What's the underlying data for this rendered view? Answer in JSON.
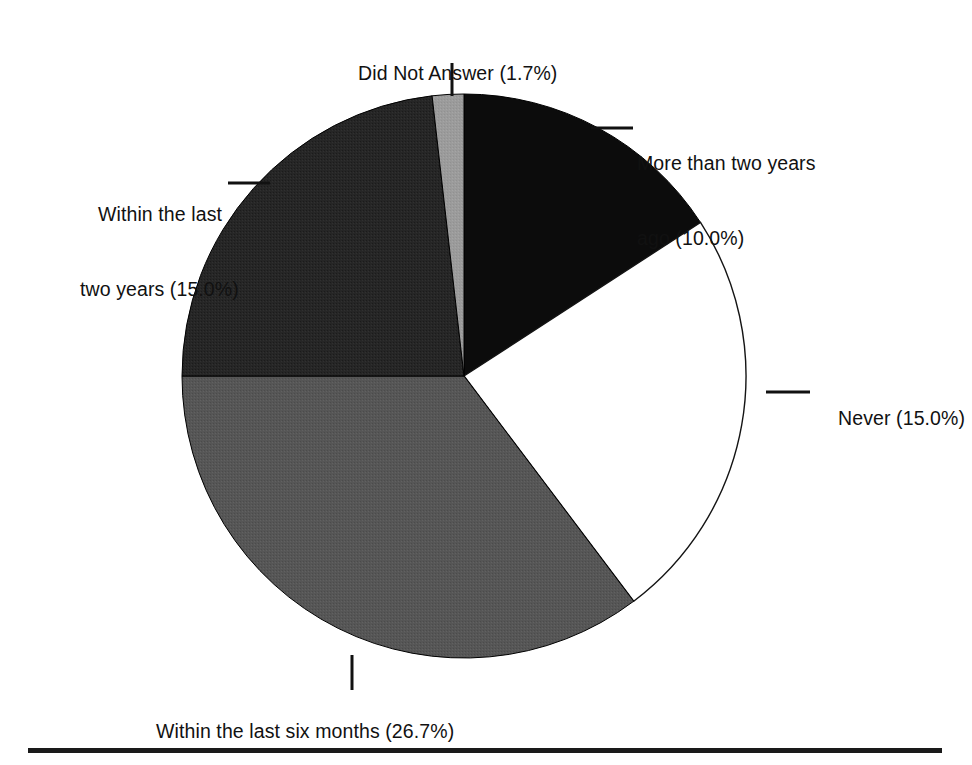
{
  "figure": {
    "background_color": "#ffffff",
    "text_color": "#111111",
    "baseline_rule_color": "#1a1a1a"
  },
  "chart_data": {
    "type": "pie",
    "title": "",
    "subtitle": "",
    "xlabel": "",
    "ylabel": "",
    "legend_position": "none",
    "grid": false,
    "labels_outside": true,
    "units": "percent",
    "categories": [
      "More than two years ago",
      "Never",
      "Within the last six months",
      "Within the last two years",
      "Did Not Answer"
    ],
    "values": [
      10.0,
      15.0,
      26.7,
      15.0,
      1.7
    ],
    "value_labels": [
      "10.0%",
      "15.0%",
      "26.7%",
      "15.0%",
      "1.7%"
    ],
    "display_labels": [
      "More than two years\nago (10.0%)",
      "Never (15.0%)",
      "Within the last six months (26.7%)",
      "Within the last\ntwo years (15.0%)",
      "Did Not Answer (1.7%)"
    ],
    "slice_colors": [
      "#0c0c0c",
      "#ffffff",
      "#555555",
      "#262626",
      "#9a9a9a"
    ],
    "slice_edge_color": "#000000",
    "start_angle_deg": 0,
    "direction": "clockwise",
    "geometry": {
      "center_x": 464,
      "center_y": 376,
      "radius": 282,
      "slice_angles_deg": [
        {
          "name": "More than two years ago",
          "start": 0,
          "end": 57
        },
        {
          "name": "Never",
          "start": 57,
          "end": 143
        },
        {
          "name": "Within the last six months",
          "start": 143,
          "end": 270
        },
        {
          "name": "Within the last two years",
          "start": 270,
          "end": 353.5
        },
        {
          "name": "Did Not Answer",
          "start": 353.5,
          "end": 360
        }
      ]
    }
  },
  "labels": {
    "did_not_answer": "Did Not Answer (1.7%)",
    "more_than_two_years_line1": "More than two years",
    "more_than_two_years_line2": "ago (10.0%)",
    "within_two_years_line1": "Within the last",
    "within_two_years_line2": "two years (15.0%)",
    "never": "Never (15.0%)",
    "within_six_months": "Within the last six months (26.7%)"
  }
}
